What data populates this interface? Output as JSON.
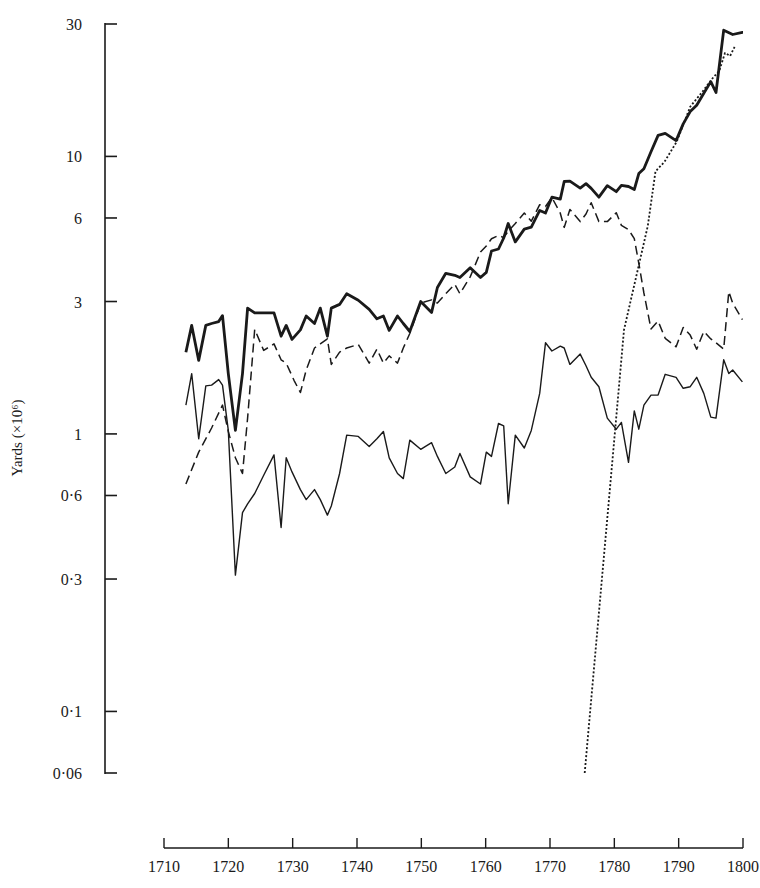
{
  "chart_data": {
    "type": "line",
    "title": "",
    "xlabel": "",
    "ylabel": "Yards (×10⁶)",
    "yscale": "log",
    "xlim": [
      1710,
      1800
    ],
    "ylim": [
      0.06,
      30
    ],
    "grid": false,
    "legend": null,
    "x_ticks": [
      1710,
      1720,
      1730,
      1740,
      1750,
      1760,
      1770,
      1780,
      1790,
      1800
    ],
    "x_tick_labels": [
      "1710",
      "1720",
      "1730",
      "1740",
      "1750",
      "1760",
      "1770",
      "1780",
      "1790",
      "1800"
    ],
    "y_ticks": [
      30,
      10,
      6,
      3,
      1,
      0.6,
      0.3,
      0.1,
      0.06
    ],
    "y_tick_labels": [
      "30",
      "10",
      "6",
      "3",
      "1",
      "0·6",
      "0·3",
      "0·1",
      "0·06"
    ],
    "series": [
      {
        "name": "total",
        "style": "thick-solid",
        "x": [
          1713.4,
          1714.3,
          1715.4,
          1716.5,
          1717.4,
          1718.5,
          1719.1,
          1720.0,
          1721.1,
          1722.2,
          1723.0,
          1724.1,
          1725.5,
          1727.1,
          1728.2,
          1729.0,
          1729.9,
          1731.2,
          1732.1,
          1733.4,
          1734.3,
          1735.4,
          1736.0,
          1737.3,
          1738.4,
          1740.2,
          1741.9,
          1743.1,
          1744.1,
          1745.0,
          1746.3,
          1747.2,
          1748.2,
          1749.9,
          1751.6,
          1752.5,
          1753.8,
          1755.2,
          1756.0,
          1757.6,
          1759.2,
          1760.1,
          1760.9,
          1762.0,
          1762.8,
          1763.5,
          1764.6,
          1766.0,
          1767.1,
          1768.4,
          1769.3,
          1770.3,
          1771.6,
          1772.2,
          1773.1,
          1774.7,
          1775.6,
          1776.4,
          1777.6,
          1778.9,
          1780.3,
          1781.1,
          1782.2,
          1783.1,
          1783.8,
          1784.6,
          1785.7,
          1786.8,
          1787.9,
          1789.6,
          1790.7,
          1791.8,
          1792.8,
          1793.9,
          1795.0,
          1795.8,
          1797.0,
          1798.4,
          1799.9,
          1800.0
        ],
        "y": [
          1.97,
          2.46,
          1.84,
          2.46,
          2.5,
          2.54,
          2.67,
          1.65,
          1.03,
          1.65,
          2.84,
          2.73,
          2.73,
          2.73,
          2.25,
          2.46,
          2.19,
          2.37,
          2.66,
          2.5,
          2.84,
          2.25,
          2.84,
          2.93,
          3.2,
          3.03,
          2.81,
          2.6,
          2.66,
          2.36,
          2.66,
          2.5,
          2.34,
          3.0,
          2.74,
          3.37,
          3.79,
          3.73,
          3.66,
          3.97,
          3.66,
          3.82,
          4.56,
          4.64,
          5.08,
          5.73,
          4.92,
          5.47,
          5.56,
          6.39,
          6.25,
          7.13,
          7.02,
          8.12,
          8.14,
          7.69,
          7.98,
          7.67,
          7.13,
          7.84,
          7.46,
          7.87,
          7.79,
          7.6,
          8.67,
          9.03,
          10.4,
          11.9,
          12.1,
          11.4,
          13.1,
          14.5,
          15.3,
          16.9,
          18.6,
          17.0,
          28.5,
          27.5,
          28.0,
          28.0
        ]
      },
      {
        "name": "dashed series",
        "style": "dashed",
        "x": [
          1713.4,
          1715.4,
          1717.4,
          1719.1,
          1720.0,
          1721.1,
          1722.2,
          1723.0,
          1724.1,
          1725.5,
          1727.1,
          1728.2,
          1729.0,
          1730.2,
          1731.2,
          1732.1,
          1733.4,
          1734.3,
          1735.4,
          1736.0,
          1737.3,
          1738.4,
          1740.2,
          1741.9,
          1743.1,
          1744.1,
          1745.0,
          1746.3,
          1747.2,
          1748.2,
          1749.9,
          1751.6,
          1752.5,
          1753.8,
          1755.2,
          1756.0,
          1757.6,
          1759.2,
          1760.1,
          1760.9,
          1762.0,
          1762.8,
          1763.5,
          1764.6,
          1766.0,
          1767.1,
          1768.4,
          1769.3,
          1770.3,
          1771.6,
          1772.2,
          1773.1,
          1774.7,
          1775.6,
          1776.4,
          1777.6,
          1778.9,
          1780.3,
          1781.1,
          1782.2,
          1783.1,
          1783.8,
          1784.6,
          1785.7,
          1786.8,
          1787.9,
          1789.6,
          1790.7,
          1791.8,
          1792.8,
          1793.9,
          1795.0,
          1795.8,
          1797.0,
          1797.8,
          1798.4,
          1799.9
        ],
        "y": [
          0.66,
          0.86,
          1.05,
          1.27,
          1.02,
          0.82,
          0.72,
          1.14,
          2.38,
          2.0,
          2.11,
          1.85,
          1.8,
          1.56,
          1.41,
          1.7,
          2.04,
          2.11,
          2.2,
          1.78,
          1.97,
          2.04,
          2.1,
          1.8,
          2.02,
          1.8,
          1.91,
          1.8,
          2.04,
          2.3,
          2.96,
          3.04,
          2.96,
          3.2,
          3.46,
          3.2,
          3.68,
          4.52,
          4.75,
          5.05,
          5.19,
          5.1,
          5.38,
          5.73,
          6.25,
          5.84,
          6.7,
          6.6,
          7.11,
          6.24,
          5.55,
          6.44,
          5.82,
          6.2,
          6.81,
          5.82,
          5.82,
          6.27,
          5.64,
          5.45,
          5.05,
          4.12,
          3.22,
          2.39,
          2.55,
          2.21,
          2.06,
          2.42,
          2.27,
          2.02,
          2.34,
          2.2,
          2.13,
          2.02,
          3.26,
          2.96,
          2.58
        ]
      },
      {
        "name": "thin solid series",
        "style": "thin-solid",
        "x": [
          1713.4,
          1714.3,
          1715.4,
          1716.5,
          1717.4,
          1718.5,
          1719.1,
          1720.0,
          1721.1,
          1722.2,
          1723.0,
          1724.1,
          1725.5,
          1727.1,
          1728.2,
          1729.0,
          1729.9,
          1731.2,
          1732.1,
          1733.4,
          1734.3,
          1735.4,
          1736.0,
          1737.3,
          1738.4,
          1740.2,
          1741.9,
          1743.1,
          1744.1,
          1745.0,
          1746.3,
          1747.2,
          1748.2,
          1749.9,
          1751.6,
          1752.5,
          1753.8,
          1755.2,
          1756.0,
          1757.6,
          1759.2,
          1760.1,
          1760.9,
          1762.0,
          1762.8,
          1763.5,
          1764.6,
          1766.0,
          1767.1,
          1768.4,
          1769.3,
          1770.3,
          1771.6,
          1772.2,
          1773.1,
          1774.7,
          1775.6,
          1776.4,
          1777.6,
          1778.9,
          1780.3,
          1781.1,
          1782.2,
          1783.1,
          1783.8,
          1784.6,
          1785.7,
          1786.8,
          1787.9,
          1789.6,
          1790.7,
          1791.8,
          1792.8,
          1793.9,
          1795.0,
          1795.8,
          1797.0,
          1797.8,
          1798.4,
          1799.9
        ],
        "y": [
          1.27,
          1.65,
          0.96,
          1.49,
          1.5,
          1.57,
          1.5,
          1.03,
          0.31,
          0.52,
          0.56,
          0.61,
          0.71,
          0.84,
          0.46,
          0.82,
          0.73,
          0.63,
          0.58,
          0.63,
          0.58,
          0.51,
          0.55,
          0.72,
          0.99,
          0.98,
          0.9,
          0.96,
          1.02,
          0.82,
          0.72,
          0.69,
          0.95,
          0.88,
          0.93,
          0.83,
          0.72,
          0.76,
          0.85,
          0.7,
          0.66,
          0.86,
          0.83,
          1.09,
          1.07,
          0.56,
          0.99,
          0.89,
          1.03,
          1.4,
          2.13,
          1.99,
          2.07,
          2.04,
          1.78,
          1.94,
          1.76,
          1.6,
          1.48,
          1.14,
          1.04,
          1.1,
          0.79,
          1.21,
          1.04,
          1.27,
          1.38,
          1.38,
          1.64,
          1.6,
          1.46,
          1.48,
          1.6,
          1.4,
          1.15,
          1.14,
          1.85,
          1.65,
          1.7,
          1.54
        ]
      },
      {
        "name": "dotted series",
        "style": "dotted",
        "x": [
          1775.4,
          1781.5,
          1785.2,
          1786.4,
          1787.8,
          1789.7,
          1791.8,
          1793.6,
          1795.4,
          1796.3,
          1797.2,
          1798.0,
          1798.7
        ],
        "y": [
          0.06,
          2.37,
          5.62,
          8.83,
          9.56,
          11.3,
          15.1,
          17.0,
          19.3,
          20.3,
          23.6,
          23.0,
          24.8
        ]
      }
    ]
  }
}
